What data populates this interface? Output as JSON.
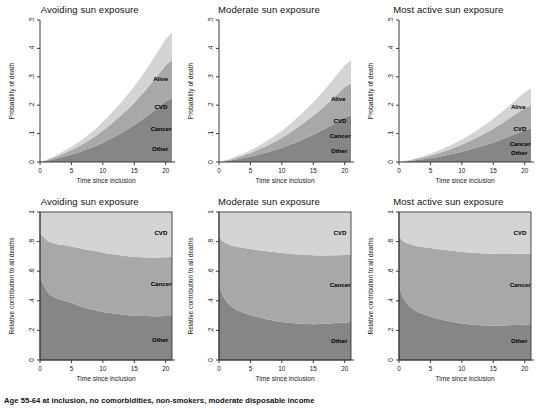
{
  "figure": {
    "footnote": "Age 55-64 at inclusion, no comorbidities, non-smokers, moderate disposable income"
  },
  "colors": {
    "cvd": "#d4d4d4",
    "cancer": "#a8a8a8",
    "other": "#868686",
    "axis": "#3a3a3a",
    "background": "#ffffff"
  },
  "labels": {
    "alive": "Alive",
    "cvd": "CVD",
    "cancer": "Cancer",
    "other": "Other",
    "xaxis": "Time since inclusion",
    "yaxis_top": "Probability of death",
    "yaxis_bottom": "Relative contribution to all deaths"
  },
  "chart_data": [
    {
      "type": "area",
      "id": "top-avoiding",
      "title": "Avoiding sun exposure",
      "xlabel": "Time since inclusion",
      "ylabel": "Probability of death",
      "xlim": [
        0,
        21
      ],
      "ylim": [
        0,
        0.5
      ],
      "xticks": [
        0,
        5,
        10,
        15,
        20
      ],
      "xticklabels": [
        "0",
        "5",
        "10",
        "15",
        "20"
      ],
      "yticks": [
        0,
        0.1,
        0.2,
        0.3,
        0.4,
        0.5
      ],
      "yticklabels": [
        "0",
        ".1",
        ".2",
        ".3",
        ".4",
        ".5"
      ],
      "x": [
        0,
        1,
        2,
        3,
        4,
        5,
        6,
        7,
        8,
        9,
        10,
        11,
        12,
        13,
        14,
        15,
        16,
        17,
        18,
        19,
        20,
        21
      ],
      "series": [
        {
          "name": "Other",
          "values": [
            0,
            0.004,
            0.009,
            0.014,
            0.02,
            0.026,
            0.033,
            0.041,
            0.049,
            0.058,
            0.068,
            0.079,
            0.091,
            0.103,
            0.116,
            0.13,
            0.145,
            0.161,
            0.178,
            0.196,
            0.214,
            0.225
          ]
        },
        {
          "name": "Cancer",
          "values": [
            0,
            0.002,
            0.005,
            0.008,
            0.012,
            0.016,
            0.02,
            0.025,
            0.03,
            0.036,
            0.042,
            0.049,
            0.056,
            0.063,
            0.071,
            0.079,
            0.088,
            0.097,
            0.107,
            0.117,
            0.127,
            0.133
          ]
        },
        {
          "name": "CVD",
          "values": [
            0,
            0.002,
            0.004,
            0.006,
            0.009,
            0.012,
            0.015,
            0.018,
            0.022,
            0.026,
            0.031,
            0.036,
            0.041,
            0.046,
            0.052,
            0.058,
            0.064,
            0.071,
            0.078,
            0.085,
            0.092,
            0.097
          ]
        }
      ],
      "annotations": [
        {
          "text": "Alive",
          "x": 18.0,
          "y": 0.285
        },
        {
          "text": "CVD",
          "x": 18.2,
          "y": 0.185
        },
        {
          "text": "Cancer",
          "x": 17.6,
          "y": 0.108
        },
        {
          "text": "Other",
          "x": 17.8,
          "y": 0.04
        }
      ]
    },
    {
      "type": "area",
      "id": "top-moderate",
      "title": "Moderate sun exposure",
      "xlabel": "Time since inclusion",
      "ylabel": "Probability of death",
      "xlim": [
        0,
        21
      ],
      "ylim": [
        0,
        0.5
      ],
      "xticks": [
        0,
        5,
        10,
        15,
        20
      ],
      "xticklabels": [
        "0",
        "5",
        "10",
        "15",
        "20"
      ],
      "yticks": [
        0,
        0.1,
        0.2,
        0.3,
        0.4,
        0.5
      ],
      "yticklabels": [
        "0",
        ".1",
        ".2",
        ".3",
        ".4",
        ".5"
      ],
      "x": [
        0,
        1,
        2,
        3,
        4,
        5,
        6,
        7,
        8,
        9,
        10,
        11,
        12,
        13,
        14,
        15,
        16,
        17,
        18,
        19,
        20,
        21
      ],
      "series": [
        {
          "name": "Other",
          "values": [
            0,
            0.003,
            0.006,
            0.01,
            0.014,
            0.019,
            0.024,
            0.03,
            0.036,
            0.043,
            0.05,
            0.058,
            0.067,
            0.076,
            0.086,
            0.096,
            0.107,
            0.119,
            0.131,
            0.144,
            0.157,
            0.165
          ]
        },
        {
          "name": "Cancer",
          "values": [
            0,
            0.002,
            0.004,
            0.007,
            0.01,
            0.013,
            0.017,
            0.021,
            0.025,
            0.03,
            0.035,
            0.041,
            0.047,
            0.053,
            0.06,
            0.067,
            0.074,
            0.082,
            0.09,
            0.098,
            0.107,
            0.112
          ]
        },
        {
          "name": "CVD",
          "values": [
            0,
            0.001,
            0.003,
            0.005,
            0.007,
            0.009,
            0.012,
            0.015,
            0.018,
            0.021,
            0.025,
            0.029,
            0.033,
            0.038,
            0.043,
            0.048,
            0.053,
            0.059,
            0.065,
            0.071,
            0.077,
            0.081
          ]
        }
      ],
      "annotations": [
        {
          "text": "Alive",
          "x": 17.8,
          "y": 0.215
        },
        {
          "text": "CVD",
          "x": 18.2,
          "y": 0.138
        },
        {
          "text": "Cancer",
          "x": 17.6,
          "y": 0.083
        },
        {
          "text": "Other",
          "x": 17.8,
          "y": 0.03
        }
      ]
    },
    {
      "type": "area",
      "id": "top-most-active",
      "title": "Most active sun exposure",
      "xlabel": "Time since inclusion",
      "ylabel": "Probability of death",
      "xlim": [
        0,
        21
      ],
      "ylim": [
        0,
        0.5
      ],
      "xticks": [
        0,
        5,
        10,
        15,
        20
      ],
      "xticklabels": [
        "0",
        "5",
        "10",
        "15",
        "20"
      ],
      "yticks": [
        0,
        0.1,
        0.2,
        0.3,
        0.4,
        0.5
      ],
      "yticklabels": [
        "0",
        ".1",
        ".2",
        ".3",
        ".4",
        ".5"
      ],
      "x": [
        0,
        1,
        2,
        3,
        4,
        5,
        6,
        7,
        8,
        9,
        10,
        11,
        12,
        13,
        14,
        15,
        16,
        17,
        18,
        19,
        20,
        21
      ],
      "series": [
        {
          "name": "Other",
          "values": [
            0,
            0.002,
            0.004,
            0.007,
            0.01,
            0.013,
            0.017,
            0.021,
            0.026,
            0.031,
            0.036,
            0.042,
            0.048,
            0.055,
            0.062,
            0.069,
            0.077,
            0.085,
            0.094,
            0.103,
            0.112,
            0.118
          ]
        },
        {
          "name": "Cancer",
          "values": [
            0,
            0.001,
            0.003,
            0.005,
            0.007,
            0.009,
            0.012,
            0.015,
            0.018,
            0.021,
            0.025,
            0.029,
            0.034,
            0.038,
            0.043,
            0.048,
            0.054,
            0.06,
            0.066,
            0.072,
            0.078,
            0.082
          ]
        },
        {
          "name": "CVD",
          "values": [
            0,
            0.001,
            0.002,
            0.003,
            0.005,
            0.007,
            0.009,
            0.011,
            0.013,
            0.016,
            0.018,
            0.021,
            0.024,
            0.028,
            0.031,
            0.035,
            0.039,
            0.043,
            0.047,
            0.052,
            0.056,
            0.059
          ]
        }
      ],
      "annotations": [
        {
          "text": "Alive",
          "x": 17.8,
          "y": 0.185
        },
        {
          "text": "CVD",
          "x": 18.2,
          "y": 0.108
        },
        {
          "text": "Cancer",
          "x": 17.6,
          "y": 0.055
        },
        {
          "text": "Other",
          "x": 17.8,
          "y": 0.023
        }
      ]
    },
    {
      "type": "area",
      "id": "bottom-avoiding",
      "title": "Avoiding sun exposure",
      "xlabel": "Time since inclusion",
      "ylabel": "Relative contribution to all deaths",
      "xlim": [
        0,
        21
      ],
      "ylim": [
        0,
        1
      ],
      "xticks": [
        0,
        5,
        10,
        15,
        20
      ],
      "xticklabels": [
        "0",
        "5",
        "10",
        "15",
        "20"
      ],
      "yticks": [
        0,
        0.2,
        0.4,
        0.6,
        0.8,
        1
      ],
      "yticklabels": [
        "0",
        ".2",
        ".4",
        ".6",
        ".8",
        "1"
      ],
      "x": [
        0,
        0.4,
        0.8,
        1.2,
        1.6,
        2,
        3,
        4,
        5,
        6,
        7,
        8,
        9,
        10,
        11,
        12,
        13,
        14,
        15,
        16,
        17,
        18,
        19,
        20,
        21
      ],
      "series": [
        {
          "name": "Other",
          "values": [
            0.55,
            0.52,
            0.49,
            0.46,
            0.44,
            0.43,
            0.41,
            0.4,
            0.385,
            0.37,
            0.355,
            0.345,
            0.335,
            0.325,
            0.318,
            0.312,
            0.307,
            0.303,
            0.3,
            0.298,
            0.297,
            0.296,
            0.296,
            0.297,
            0.298
          ]
        },
        {
          "name": "Cancer",
          "values": [
            0.3,
            0.32,
            0.33,
            0.345,
            0.355,
            0.36,
            0.37,
            0.375,
            0.382,
            0.388,
            0.393,
            0.396,
            0.399,
            0.4,
            0.4,
            0.4,
            0.399,
            0.398,
            0.397,
            0.396,
            0.396,
            0.396,
            0.396,
            0.397,
            0.398
          ]
        },
        {
          "name": "CVD",
          "values": [
            0.15,
            0.16,
            0.18,
            0.195,
            0.205,
            0.21,
            0.22,
            0.225,
            0.233,
            0.242,
            0.252,
            0.259,
            0.266,
            0.275,
            0.282,
            0.288,
            0.294,
            0.299,
            0.303,
            0.306,
            0.307,
            0.308,
            0.308,
            0.306,
            0.304
          ]
        }
      ],
      "annotations": [
        {
          "text": "CVD",
          "x": 18.2,
          "y": 0.845
        },
        {
          "text": "Cancer",
          "x": 17.6,
          "y": 0.5
        },
        {
          "text": "Other",
          "x": 17.8,
          "y": 0.125
        }
      ]
    },
    {
      "type": "area",
      "id": "bottom-moderate",
      "title": "Moderate sun exposure",
      "xlabel": "Time since inclusion",
      "ylabel": "Relative contribution to all deaths",
      "xlim": [
        0,
        21
      ],
      "ylim": [
        0,
        1
      ],
      "xticks": [
        0,
        5,
        10,
        15,
        20
      ],
      "xticklabels": [
        "0",
        "5",
        "10",
        "15",
        "20"
      ],
      "yticks": [
        0,
        0.2,
        0.4,
        0.6,
        0.8,
        1
      ],
      "yticklabels": [
        "0",
        ".2",
        ".4",
        ".6",
        ".8",
        "1"
      ],
      "x": [
        0,
        0.4,
        0.8,
        1.2,
        1.6,
        2,
        3,
        4,
        5,
        6,
        7,
        8,
        9,
        10,
        11,
        12,
        13,
        14,
        15,
        16,
        17,
        18,
        19,
        20,
        21
      ],
      "series": [
        {
          "name": "Other",
          "values": [
            0.5,
            0.46,
            0.42,
            0.395,
            0.375,
            0.36,
            0.335,
            0.318,
            0.303,
            0.292,
            0.282,
            0.272,
            0.264,
            0.257,
            0.252,
            0.248,
            0.245,
            0.243,
            0.242,
            0.243,
            0.245,
            0.248,
            0.251,
            0.254,
            0.256
          ]
        },
        {
          "name": "Cancer",
          "values": [
            0.33,
            0.355,
            0.375,
            0.392,
            0.404,
            0.413,
            0.428,
            0.438,
            0.447,
            0.452,
            0.457,
            0.461,
            0.464,
            0.466,
            0.467,
            0.467,
            0.467,
            0.466,
            0.465,
            0.463,
            0.461,
            0.459,
            0.457,
            0.455,
            0.454
          ]
        },
        {
          "name": "CVD",
          "values": [
            0.17,
            0.185,
            0.205,
            0.213,
            0.221,
            0.227,
            0.237,
            0.244,
            0.25,
            0.256,
            0.261,
            0.267,
            0.272,
            0.277,
            0.281,
            0.285,
            0.288,
            0.291,
            0.293,
            0.294,
            0.294,
            0.293,
            0.292,
            0.291,
            0.29
          ]
        }
      ],
      "annotations": [
        {
          "text": "CVD",
          "x": 18.2,
          "y": 0.845
        },
        {
          "text": "Cancer",
          "x": 17.6,
          "y": 0.495
        },
        {
          "text": "Other",
          "x": 17.8,
          "y": 0.115
        }
      ]
    },
    {
      "type": "area",
      "id": "bottom-most-active",
      "title": "Most active sun exposure",
      "xlabel": "Time since inclusion",
      "ylabel": "Relative contribution to all deaths",
      "xlim": [
        0,
        21
      ],
      "ylim": [
        0,
        1
      ],
      "xticks": [
        0,
        5,
        10,
        15,
        20
      ],
      "xticklabels": [
        "0",
        "5",
        "10",
        "15",
        "20"
      ],
      "yticks": [
        0,
        0.2,
        0.4,
        0.6,
        0.8,
        1
      ],
      "yticklabels": [
        "0",
        ".2",
        ".4",
        ".6",
        ".8",
        "1"
      ],
      "x": [
        0,
        0.4,
        0.8,
        1.2,
        1.6,
        2,
        3,
        4,
        5,
        6,
        7,
        8,
        9,
        10,
        11,
        12,
        13,
        14,
        15,
        16,
        17,
        18,
        19,
        20,
        21
      ],
      "series": [
        {
          "name": "Other",
          "values": [
            0.5,
            0.45,
            0.41,
            0.385,
            0.365,
            0.35,
            0.325,
            0.307,
            0.292,
            0.28,
            0.27,
            0.261,
            0.253,
            0.247,
            0.242,
            0.238,
            0.235,
            0.233,
            0.232,
            0.233,
            0.234,
            0.236,
            0.238,
            0.24,
            0.242
          ]
        },
        {
          "name": "Cancer",
          "values": [
            0.335,
            0.365,
            0.388,
            0.405,
            0.418,
            0.428,
            0.444,
            0.455,
            0.464,
            0.47,
            0.475,
            0.479,
            0.482,
            0.484,
            0.485,
            0.486,
            0.486,
            0.486,
            0.485,
            0.484,
            0.483,
            0.481,
            0.48,
            0.478,
            0.477
          ]
        },
        {
          "name": "CVD",
          "values": [
            0.165,
            0.185,
            0.202,
            0.21,
            0.217,
            0.222,
            0.231,
            0.238,
            0.244,
            0.25,
            0.255,
            0.26,
            0.265,
            0.269,
            0.273,
            0.276,
            0.279,
            0.281,
            0.283,
            0.283,
            0.283,
            0.283,
            0.282,
            0.282,
            0.281
          ]
        }
      ],
      "annotations": [
        {
          "text": "CVD",
          "x": 18.2,
          "y": 0.845
        },
        {
          "text": "Cancer",
          "x": 17.6,
          "y": 0.495
        },
        {
          "text": "Other",
          "x": 17.8,
          "y": 0.115
        }
      ]
    }
  ]
}
